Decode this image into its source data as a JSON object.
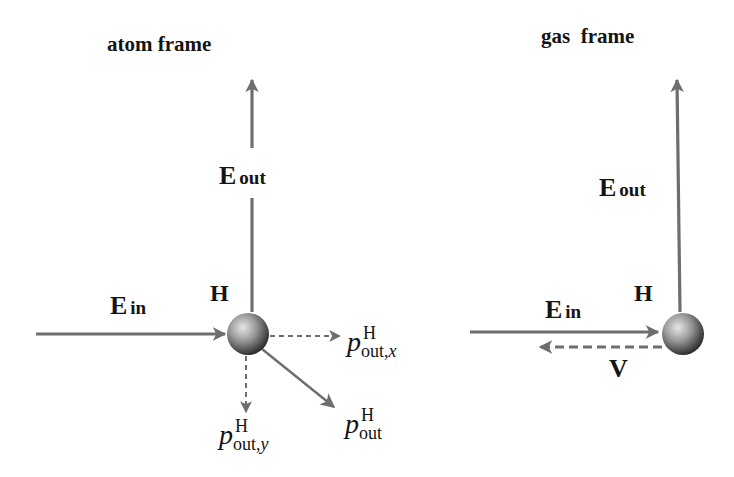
{
  "colors": {
    "arrow": "#6e6e6e",
    "text": "#141414",
    "sphere_light": "#d8d8d8",
    "sphere_dark": "#2a2a2a"
  },
  "panels": [
    {
      "title": "atom frame",
      "atom_label": "H",
      "vectors": {
        "E_in": {
          "symbol": "E",
          "subscript": "in"
        },
        "E_out": {
          "symbol": "E",
          "subscript": "out"
        }
      },
      "momenta": [
        {
          "symbol": "p",
          "superscript": "H",
          "subscript": "out,",
          "subscript_var": "x"
        },
        {
          "symbol": "p",
          "superscript": "H",
          "subscript": "out,",
          "subscript_var": "y"
        },
        {
          "symbol": "p",
          "superscript": "H",
          "subscript": "out",
          "subscript_var": ""
        }
      ]
    },
    {
      "title": "gas  frame",
      "atom_label": "H",
      "vectors": {
        "E_in": {
          "symbol": "E",
          "subscript": "in"
        },
        "E_out": {
          "symbol": "E",
          "subscript": "out"
        },
        "V": {
          "symbol": "V"
        }
      }
    }
  ]
}
